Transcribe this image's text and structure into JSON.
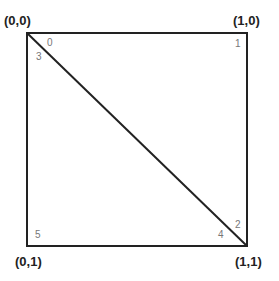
{
  "diagram": {
    "type": "unit-square-triangulation",
    "stroke_color": "#222222",
    "index_color": "#777777",
    "corners": [
      {
        "label": "(0,0)",
        "position": "top-left"
      },
      {
        "label": "(1,0)",
        "position": "top-right"
      },
      {
        "label": "(0,1)",
        "position": "bottom-left"
      },
      {
        "label": "(1,1)",
        "position": "bottom-right"
      }
    ],
    "vertex_indices": [
      {
        "label": "0",
        "near": "top-left",
        "triangle": "upper"
      },
      {
        "label": "1",
        "near": "top-right",
        "triangle": "upper"
      },
      {
        "label": "2",
        "near": "bottom-right",
        "triangle": "upper"
      },
      {
        "label": "3",
        "near": "top-left",
        "triangle": "lower"
      },
      {
        "label": "4",
        "near": "bottom-right",
        "triangle": "lower"
      },
      {
        "label": "5",
        "near": "bottom-left",
        "triangle": "lower"
      }
    ]
  }
}
